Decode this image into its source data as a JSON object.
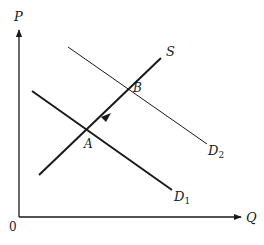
{
  "diagram": {
    "type": "supply-demand",
    "axes": {
      "y_label": "P",
      "x_label": "Q",
      "origin_label": "0"
    },
    "curves": {
      "supply": {
        "label": "S"
      },
      "demand_1": {
        "label": "D",
        "subscript": "1"
      },
      "demand_2": {
        "label": "D",
        "subscript": "2"
      }
    },
    "points": {
      "equilibrium_a": {
        "label": "A"
      },
      "equilibrium_b": {
        "label": "B"
      }
    },
    "movement_arrow": {
      "from": "A",
      "to": "B",
      "along": "S"
    }
  },
  "colors": {
    "line": "#1a1a1a",
    "background": "#ffffff"
  }
}
